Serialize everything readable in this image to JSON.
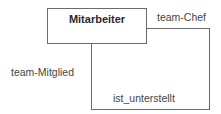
{
  "diagram": {
    "type": "er-recursive-relationship",
    "entity": {
      "name": "Mitarbeiter"
    },
    "relationship": {
      "name": "ist_unterstellt"
    },
    "roles": [
      {
        "name": "team-Chef",
        "position": "top-right"
      },
      {
        "name": "team-Mitglied",
        "position": "left"
      }
    ],
    "colors": {
      "line": "#6a6a6a",
      "text": "#444444",
      "background": "#ffffff"
    }
  }
}
